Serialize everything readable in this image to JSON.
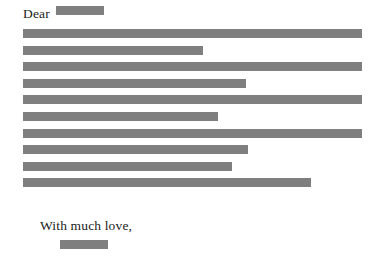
{
  "document": {
    "type": "redacted-letter",
    "page_size": {
      "width": 379,
      "height": 260
    },
    "background_color": "#ffffff",
    "redaction_color": "#7f7f7f",
    "text_color": "#1c1c1c",
    "salutation": {
      "label": "Dear",
      "redaction": {
        "name": "recipient-name-redaction",
        "width_px": 48,
        "height_px": 9
      }
    },
    "body": {
      "redaction_lines": [
        {
          "index": 1,
          "width_px": 339,
          "height_px": 9,
          "full_width": true
        },
        {
          "index": 2,
          "width_px": 180,
          "height_px": 9,
          "full_width": false
        },
        {
          "index": 3,
          "width_px": 339,
          "height_px": 9,
          "full_width": true
        },
        {
          "index": 4,
          "width_px": 223,
          "height_px": 9,
          "full_width": false
        },
        {
          "index": 5,
          "width_px": 339,
          "height_px": 9,
          "full_width": true
        },
        {
          "index": 6,
          "width_px": 195,
          "height_px": 9,
          "full_width": false
        },
        {
          "index": 7,
          "width_px": 339,
          "height_px": 9,
          "full_width": true
        },
        {
          "index": 8,
          "width_px": 225,
          "height_px": 9,
          "full_width": false
        },
        {
          "index": 9,
          "width_px": 209,
          "height_px": 9,
          "full_width": false
        },
        {
          "index": 10,
          "width_px": 288,
          "height_px": 9,
          "full_width": false
        }
      ]
    },
    "closing": {
      "label": "With much love,",
      "signature_redaction": {
        "name": "signature-redaction",
        "width_px": 48,
        "height_px": 9
      }
    }
  }
}
